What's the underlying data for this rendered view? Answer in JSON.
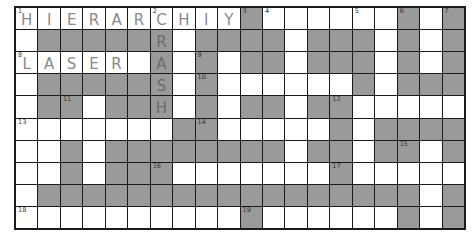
{
  "puzzle": {
    "rows": 10,
    "cols": 20,
    "colors": {
      "white": "#ffffff",
      "shaded": "#9a9a9a",
      "border": "#1a1a1a",
      "handwriting": "#8a8a8a"
    },
    "layout": [
      "WWWWWWWWWWGWWWWWWGWG",
      "WGGGGGGWGGGGWGGGWGWG",
      "WWWWWWGWGWGGWGGGWGWG",
      "WGGGGGGWGWWWWWWGWGGG",
      "WGGWGGGWGWGGWGGWWWWW",
      "WWWWWWWGGWWWWWGWGGGG",
      "WWGWGGGGGGGGWGGWGGWG",
      "WWGWGGGWWWWWWWGWWWWW",
      "WGGGGGGGGGGGGGGGGGWG",
      "WWWWWWWWWWGWWWWWWGWG"
    ],
    "numbers": [
      {
        "r": 0,
        "c": 0,
        "n": "1"
      },
      {
        "r": 0,
        "c": 6,
        "n": "2"
      },
      {
        "r": 0,
        "c": 10,
        "n": "3"
      },
      {
        "r": 0,
        "c": 11,
        "n": "4"
      },
      {
        "r": 0,
        "c": 15,
        "n": "5"
      },
      {
        "r": 0,
        "c": 17,
        "n": "6"
      },
      {
        "r": 0,
        "c": 19,
        "n": "7"
      },
      {
        "r": 2,
        "c": 0,
        "n": "8"
      },
      {
        "r": 2,
        "c": 8,
        "n": "9"
      },
      {
        "r": 3,
        "c": 8,
        "n": "10"
      },
      {
        "r": 4,
        "c": 2,
        "n": "11"
      },
      {
        "r": 4,
        "c": 14,
        "n": "12"
      },
      {
        "r": 5,
        "c": 0,
        "n": "13"
      },
      {
        "r": 5,
        "c": 8,
        "n": "14"
      },
      {
        "r": 6,
        "c": 17,
        "n": "15"
      },
      {
        "r": 7,
        "c": 6,
        "n": "16"
      },
      {
        "r": 7,
        "c": 14,
        "n": "17"
      },
      {
        "r": 9,
        "c": 0,
        "n": "18"
      },
      {
        "r": 9,
        "c": 10,
        "n": "19"
      }
    ],
    "entries": [
      {
        "r": 0,
        "c": 0,
        "ch": "H"
      },
      {
        "r": 0,
        "c": 1,
        "ch": "I"
      },
      {
        "r": 0,
        "c": 2,
        "ch": "E"
      },
      {
        "r": 0,
        "c": 3,
        "ch": "R"
      },
      {
        "r": 0,
        "c": 4,
        "ch": "A"
      },
      {
        "r": 0,
        "c": 5,
        "ch": "R"
      },
      {
        "r": 0,
        "c": 6,
        "ch": "C"
      },
      {
        "r": 0,
        "c": 7,
        "ch": "H"
      },
      {
        "r": 0,
        "c": 8,
        "ch": "I"
      },
      {
        "r": 0,
        "c": 9,
        "ch": "Y"
      },
      {
        "r": 1,
        "c": 6,
        "ch": "R"
      },
      {
        "r": 2,
        "c": 0,
        "ch": "L"
      },
      {
        "r": 2,
        "c": 1,
        "ch": "A"
      },
      {
        "r": 2,
        "c": 2,
        "ch": "S"
      },
      {
        "r": 2,
        "c": 3,
        "ch": "E"
      },
      {
        "r": 2,
        "c": 4,
        "ch": "R"
      },
      {
        "r": 2,
        "c": 6,
        "ch": "A"
      },
      {
        "r": 3,
        "c": 6,
        "ch": "S"
      },
      {
        "r": 4,
        "c": 6,
        "ch": "H"
      }
    ]
  }
}
